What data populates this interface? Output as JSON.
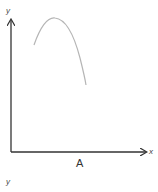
{
  "figure": {
    "caption": "A",
    "axes": {
      "x_label": "x",
      "y_label": "y"
    },
    "curve": {
      "shape": "inverted parabola (rises to a maximum then falls)",
      "color": "#b5b5b5",
      "start": [
        34,
        45
      ],
      "peak": [
        55,
        18
      ],
      "end": [
        86,
        85
      ]
    },
    "axis_color": "#333333"
  },
  "next_figure": {
    "y_label": "y"
  }
}
